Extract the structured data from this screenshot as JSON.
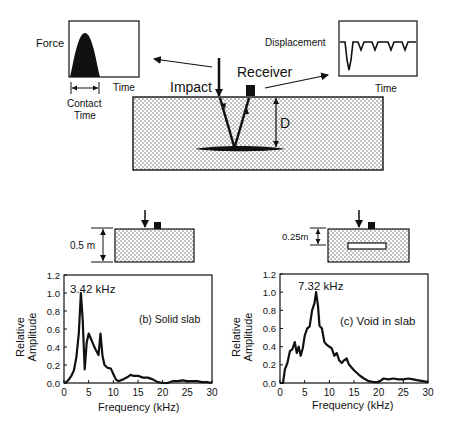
{
  "top_diagram": {
    "force_plot": {
      "ylabel": "Force",
      "xlabel": "Time",
      "contact_label_1": "Contact",
      "contact_label_2": "Time"
    },
    "displacement_plot": {
      "ylabel": "Displacement",
      "xlabel": "Time"
    },
    "impact_label": "Impact",
    "receiver_label": "Receiver",
    "depth_label": "D"
  },
  "slab_b": {
    "thickness_label": "0.5 m"
  },
  "slab_c": {
    "void_depth_label": "0.25m"
  },
  "colors": {
    "ink": "#111111",
    "background": "#ffffff",
    "concrete_dot": "#555555"
  },
  "chart_data": [
    {
      "type": "line",
      "title": "(b) Solid slab",
      "annotation": "3.42 kHz",
      "xlabel": "Frequency (kHz)",
      "ylabel": "Relative Amplitude",
      "xlim": [
        0,
        30
      ],
      "ylim": [
        0,
        1.2
      ],
      "xticks": [
        "0",
        "5",
        "10",
        "15",
        "20",
        "25",
        "30"
      ],
      "yticks": [
        "0.0",
        "0.2",
        "0.4",
        "0.6",
        "0.8",
        "1.0",
        "1.2"
      ],
      "grid": false,
      "x": [
        0,
        0.5,
        1,
        1.5,
        2,
        2.5,
        3,
        3.42,
        3.8,
        4.2,
        4.6,
        5,
        5.4,
        6,
        6.5,
        7,
        7.4,
        7.8,
        8.2,
        8.8,
        9.5,
        10,
        10.5,
        11,
        12,
        13,
        13.5,
        14,
        15,
        16,
        17,
        18,
        19,
        20,
        21,
        22,
        23,
        24,
        25,
        26,
        27,
        28,
        29,
        30
      ],
      "values": [
        0.0,
        0.01,
        0.04,
        0.08,
        0.14,
        0.28,
        0.55,
        1.0,
        0.7,
        0.15,
        0.45,
        0.55,
        0.5,
        0.42,
        0.36,
        0.31,
        0.55,
        0.3,
        0.2,
        0.17,
        0.16,
        0.1,
        0.04,
        0.02,
        0.04,
        0.07,
        0.09,
        0.08,
        0.08,
        0.06,
        0.06,
        0.04,
        0.01,
        0.0,
        0.0,
        0.02,
        0.02,
        0.03,
        0.02,
        0.02,
        0.02,
        0.01,
        0.01,
        0.0
      ]
    },
    {
      "type": "line",
      "title": "(c) Void in slab",
      "annotation": "7.32 kHz",
      "xlabel": "Frequency (kHz)",
      "ylabel": "Relative Amplitude",
      "xlim": [
        0,
        30
      ],
      "ylim": [
        0,
        1.2
      ],
      "xticks": [
        "0",
        "5",
        "10",
        "15",
        "20",
        "25",
        "30"
      ],
      "yticks": [
        "0.0",
        "0.2",
        "0.4",
        "0.6",
        "0.8",
        "1.0",
        "1.2"
      ],
      "grid": false,
      "x": [
        0,
        0.6,
        1,
        1.5,
        2,
        2.5,
        3,
        3.4,
        3.8,
        4.2,
        4.6,
        5,
        5.5,
        6,
        6.5,
        7,
        7.32,
        7.7,
        8,
        8.5,
        9,
        9.5,
        10,
        10.5,
        11,
        11.5,
        12,
        12.5,
        13,
        13.5,
        14,
        15,
        16,
        17,
        18,
        19,
        20,
        21,
        22,
        23,
        24,
        25,
        26,
        27,
        28,
        29,
        30
      ],
      "values": [
        0.0,
        0.0,
        0.15,
        0.22,
        0.35,
        0.37,
        0.45,
        0.33,
        0.4,
        0.3,
        0.38,
        0.52,
        0.6,
        0.62,
        0.8,
        0.88,
        1.0,
        0.85,
        0.63,
        0.6,
        0.45,
        0.42,
        0.4,
        0.38,
        0.3,
        0.33,
        0.25,
        0.22,
        0.25,
        0.27,
        0.2,
        0.14,
        0.09,
        0.05,
        0.02,
        0.01,
        0.01,
        0.05,
        0.04,
        0.05,
        0.04,
        0.04,
        0.05,
        0.04,
        0.03,
        0.02,
        0.01
      ]
    }
  ]
}
